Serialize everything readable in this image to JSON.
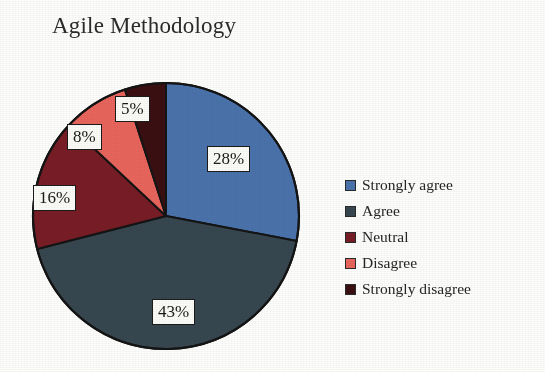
{
  "title": "Agile Methodology",
  "background_color": "#fdfdfc",
  "chart_data": {
    "type": "pie",
    "title": "Agile Methodology",
    "xlabel": "",
    "ylabel": "",
    "legend_position": "right",
    "grid": false,
    "start_angle_deg": 0,
    "direction": "clockwise",
    "categories": [
      "Strongly agree",
      "Agree",
      "Neutral",
      "Disagree",
      "Strongly disagree"
    ],
    "values": [
      28,
      43,
      16,
      8,
      5
    ],
    "value_unit": "%",
    "data_labels": [
      "28%",
      "43%",
      "16%",
      "8%",
      "5%"
    ],
    "colors": [
      "#4a72ab",
      "#37474f",
      "#781d26",
      "#e8655c",
      "#3a0f11"
    ],
    "slices": [
      {
        "label": "Strongly agree",
        "value": 28,
        "display": "28%",
        "color": "#4a72ab"
      },
      {
        "label": "Agree",
        "value": 43,
        "display": "43%",
        "color": "#37474f"
      },
      {
        "label": "Neutral",
        "value": 16,
        "display": "16%",
        "color": "#781d26"
      },
      {
        "label": "Disagree",
        "value": 8,
        "display": "8%",
        "color": "#e8655c"
      },
      {
        "label": "Strongly disagree",
        "value": 5,
        "display": "5%",
        "color": "#3a0f11"
      }
    ]
  },
  "labels": {
    "strongly_agree": "28%",
    "agree": "43%",
    "neutral": "16%",
    "disagree": "8%",
    "strongly_disagree": "5%"
  },
  "legend": {
    "items": [
      {
        "label": "Strongly agree",
        "color": "#4a72ab"
      },
      {
        "label": "Agree",
        "color": "#37474f"
      },
      {
        "label": "Neutral",
        "color": "#781d26"
      },
      {
        "label": "Disagree",
        "color": "#e8655c"
      },
      {
        "label": "Strongly disagree",
        "color": "#3a0f11"
      }
    ]
  }
}
